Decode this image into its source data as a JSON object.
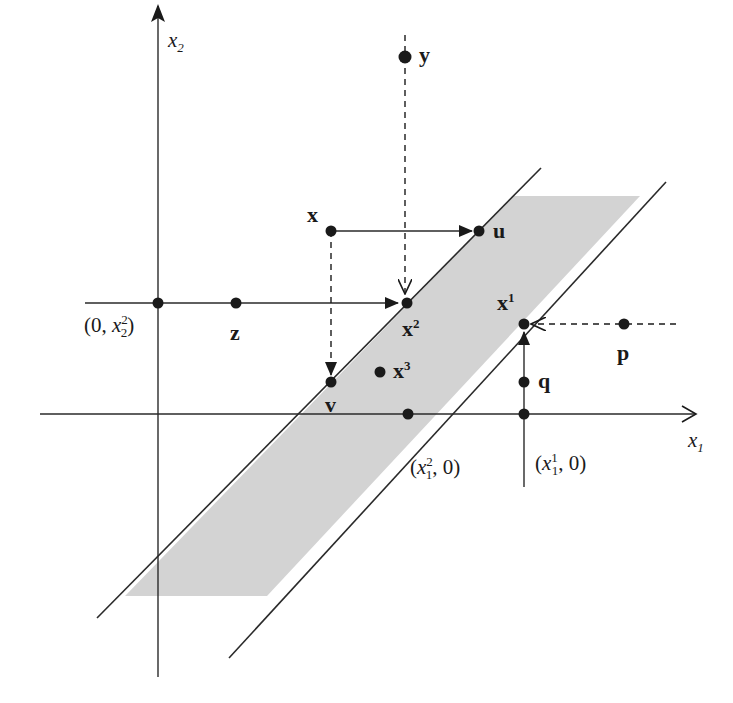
{
  "diagram": {
    "axes": {
      "x1_label": "x",
      "x1_sub": "1",
      "x2_label": "x",
      "x2_sub": "2"
    },
    "region": {
      "fill": "#d3d3d3",
      "stroke": "#2a2a2a"
    },
    "points": {
      "y": {
        "label": "y"
      },
      "x": {
        "label": "x"
      },
      "u": {
        "label": "u"
      },
      "z": {
        "label": "z"
      },
      "x2": {
        "label": "x",
        "sup": "2"
      },
      "x1": {
        "label": "x",
        "sup": "1"
      },
      "x3": {
        "label": "x",
        "sup": "3"
      },
      "p": {
        "label": "p"
      },
      "q": {
        "label": "q"
      },
      "v": {
        "label": "v"
      }
    },
    "coordinates": {
      "zero_x22": {
        "open": "(0, ",
        "var": "x",
        "sub": "2",
        "sup": "2",
        "close": ")"
      },
      "x12_zero": {
        "open": "(",
        "var": "x",
        "sub": "1",
        "sup": "2",
        "close": ", 0)"
      },
      "x11_zero": {
        "open": "(",
        "var": "x",
        "sub": "1",
        "sup": "1",
        "close": ", 0)"
      }
    }
  }
}
